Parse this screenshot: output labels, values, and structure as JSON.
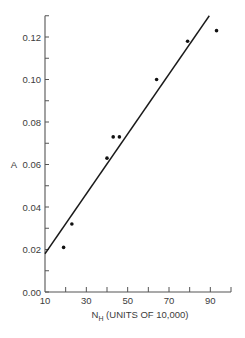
{
  "chart_data": {
    "type": "scatter",
    "title": "",
    "xlabel": "N_H (UNITS OF 10,000)",
    "xlabel_main": "N",
    "xlabel_sub": "H",
    "xlabel_rest": " (UNITS OF 10,000)",
    "ylabel": "A",
    "xlim": [
      10,
      100
    ],
    "ylim": [
      0.0,
      0.13
    ],
    "x_ticks": [
      10,
      20,
      30,
      40,
      50,
      60,
      70,
      80,
      90,
      100
    ],
    "x_tick_labels": [
      "10",
      "30",
      "50",
      "70",
      "90"
    ],
    "x_tick_label_values": [
      10,
      30,
      50,
      70,
      90
    ],
    "y_ticks": [
      0.0,
      0.01,
      0.02,
      0.03,
      0.04,
      0.05,
      0.06,
      0.07,
      0.08,
      0.09,
      0.1,
      0.11,
      0.12,
      0.13
    ],
    "y_tick_labels": [
      "0.00",
      "0.02",
      "0.04",
      "0.06",
      "0.08",
      "0.10",
      "0.12"
    ],
    "y_tick_label_values": [
      0.0,
      0.02,
      0.04,
      0.06,
      0.08,
      0.1,
      0.12
    ],
    "grid": false,
    "legend": null,
    "series": [
      {
        "name": "measurements",
        "marker": "dot",
        "x": [
          19,
          23,
          40,
          43,
          46,
          64,
          79,
          93
        ],
        "y": [
          0.021,
          0.032,
          0.063,
          0.073,
          0.073,
          0.1,
          0.118,
          0.123
        ]
      }
    ],
    "fit_line": {
      "name": "linear fit",
      "x": [
        10,
        89.5
      ],
      "y": [
        0.018,
        0.13
      ]
    },
    "colors": {
      "axis": "#555555",
      "points": "#111111",
      "line": "#1a1a1a",
      "text": "#3c3c3c"
    }
  }
}
